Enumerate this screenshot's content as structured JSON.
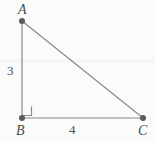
{
  "figure": {
    "kind": "right-triangle-diagram",
    "canvas": {
      "width": 155,
      "height": 141
    },
    "background_color": "#fbfbfb",
    "stroke_color": "#8a8a8a",
    "point_color": "#5a5a5a",
    "label_color": "#4a4a4a",
    "vertices": [
      {
        "id": "A",
        "label": "A",
        "x": 22,
        "y": 21
      },
      {
        "id": "B",
        "label": "B",
        "x": 22,
        "y": 118
      },
      {
        "id": "C",
        "label": "C",
        "x": 143,
        "y": 118
      }
    ],
    "edges": [
      {
        "id": "AB",
        "from": "A",
        "to": "B",
        "length_label": "3"
      },
      {
        "id": "BC",
        "from": "B",
        "to": "C",
        "length_label": "4"
      },
      {
        "id": "AC",
        "from": "A",
        "to": "C",
        "length_label": ""
      }
    ],
    "right_angle": {
      "at": "B",
      "marker": "square-corner",
      "size": 9
    },
    "labels": {
      "vertex_a": "A",
      "vertex_b": "B",
      "vertex_c": "C",
      "side_ab": "3",
      "side_bc": "4"
    }
  }
}
